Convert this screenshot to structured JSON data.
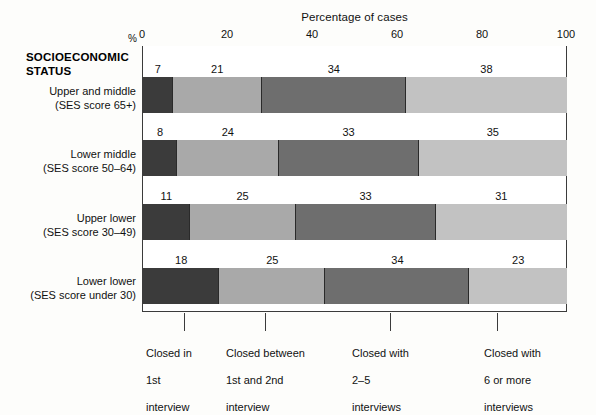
{
  "chart_data": {
    "type": "bar",
    "orientation": "horizontal",
    "stacked": true,
    "stacked_percent": true,
    "title": "Percentage of cases",
    "xlabel": "Percentage of cases",
    "ylabel": "SOCIOECONOMIC STATUS",
    "unit_symbol": "%",
    "xlim": [
      0,
      100
    ],
    "xticks": [
      0,
      20,
      40,
      60,
      80,
      100
    ],
    "xtick_labels": [
      "0",
      "20",
      "40",
      "60",
      "80",
      "100"
    ],
    "grid": false,
    "legend_position": "bottom",
    "categories": [
      "Upper and middle (SES score 65+)",
      "Lower middle (SES score 50–64)",
      "Upper lower (SES score 30–49)",
      "Lower lower (SES score under 30)"
    ],
    "series": [
      {
        "name": "Closed in 1st interview",
        "values": [
          7,
          8,
          11,
          18
        ],
        "color": "#3b3b3b"
      },
      {
        "name": "Closed between 1st and 2nd interview",
        "values": [
          21,
          24,
          25,
          25
        ],
        "color": "#a9a9a9"
      },
      {
        "name": "Closed with 2–5 interviews",
        "values": [
          34,
          33,
          33,
          34
        ],
        "color": "#6e6e6e"
      },
      {
        "name": "Closed with 6 or more interviews",
        "values": [
          38,
          35,
          31,
          23
        ],
        "color": "#c2c2c2"
      }
    ]
  },
  "axis": {
    "title": "Percentage of cases",
    "percent_symbol": "%",
    "ticks": [
      {
        "value": 0,
        "label": "0"
      },
      {
        "value": 20,
        "label": "20"
      },
      {
        "value": 40,
        "label": "40"
      },
      {
        "value": 60,
        "label": "60"
      },
      {
        "value": 80,
        "label": "80"
      },
      {
        "value": 100,
        "label": "100"
      }
    ]
  },
  "category_axis": {
    "heading_line1": "SOCIOECONOMIC",
    "heading_line2": "STATUS",
    "rows": [
      {
        "line1": "Upper and middle",
        "line2": "(SES score 65+)"
      },
      {
        "line1": "Lower middle",
        "line2": "(SES score 50–64)"
      },
      {
        "line1": "Upper lower",
        "line2": "(SES score 30–49)"
      },
      {
        "line1": "Lower lower",
        "line2": "(SES score under 30)"
      }
    ]
  },
  "bars": [
    {
      "values": [
        "7",
        "21",
        "34",
        "38"
      ]
    },
    {
      "values": [
        "8",
        "24",
        "33",
        "35"
      ]
    },
    {
      "values": [
        "11",
        "25",
        "33",
        "31"
      ]
    },
    {
      "values": [
        "18",
        "25",
        "34",
        "23"
      ]
    }
  ],
  "legend": {
    "items": [
      {
        "line1": "Closed in",
        "line2": "1st",
        "line3": "interview"
      },
      {
        "line1": "Closed between",
        "line2": "1st and 2nd",
        "line3": "interview"
      },
      {
        "line1": "Closed with",
        "line2": "2–5",
        "line3": "interviews"
      },
      {
        "line1": "Closed with",
        "line2": "6 or more",
        "line3": "interviews"
      }
    ]
  }
}
